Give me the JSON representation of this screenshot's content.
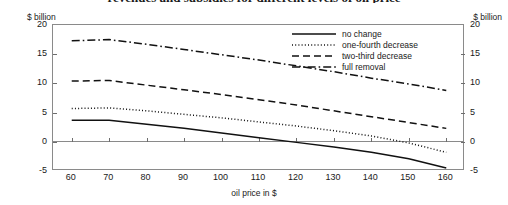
{
  "chart_data": {
    "type": "line",
    "title": "revenues and subsidies for different levels of oil price",
    "xlabel": "oil price in $",
    "ylabel": "$ billion",
    "ylabel_right": "$ billion",
    "xlim": [
      55,
      165
    ],
    "ylim": [
      -5,
      20
    ],
    "yticks": [
      20,
      15,
      10,
      5,
      0,
      -5
    ],
    "xticks": [
      60,
      70,
      80,
      90,
      100,
      110,
      120,
      130,
      140,
      150,
      160
    ],
    "grid": false,
    "legend_position": "top-right",
    "x": [
      60,
      70,
      80,
      90,
      100,
      110,
      120,
      130,
      140,
      150,
      160
    ],
    "series": [
      {
        "name": "no change",
        "style": "solid",
        "values": [
          3.7,
          3.7,
          3.0,
          2.3,
          1.5,
          0.7,
          -0.1,
          -0.9,
          -1.8,
          -2.9,
          -4.5
        ]
      },
      {
        "name": "one-fourth decrease",
        "style": "dotted",
        "values": [
          5.7,
          5.8,
          5.3,
          4.7,
          4.1,
          3.4,
          2.7,
          1.9,
          1.0,
          -0.2,
          -1.8
        ]
      },
      {
        "name": "two-third decrease",
        "style": "dashed",
        "values": [
          10.4,
          10.5,
          9.7,
          8.9,
          8.1,
          7.2,
          6.3,
          5.3,
          4.3,
          3.3,
          2.3
        ]
      },
      {
        "name": "full removal",
        "style": "dash-dot",
        "values": [
          17.3,
          17.5,
          16.7,
          15.8,
          14.9,
          14.0,
          13.0,
          12.0,
          10.9,
          9.9,
          8.8
        ]
      }
    ]
  },
  "axis": {
    "unit_left": "$ billion",
    "unit_right": "$ billion",
    "x_title": "oil price in $",
    "y_labels": [
      "20",
      "15",
      "10",
      "5",
      "0",
      "-5"
    ],
    "x_labels": [
      "60",
      "70",
      "80",
      "90",
      "100",
      "110",
      "120",
      "130",
      "140",
      "150",
      "160"
    ]
  },
  "legend": {
    "items": [
      {
        "label": "no change"
      },
      {
        "label": "one-fourth decrease"
      },
      {
        "label": "two-third decrease"
      },
      {
        "label": "full removal"
      }
    ]
  }
}
